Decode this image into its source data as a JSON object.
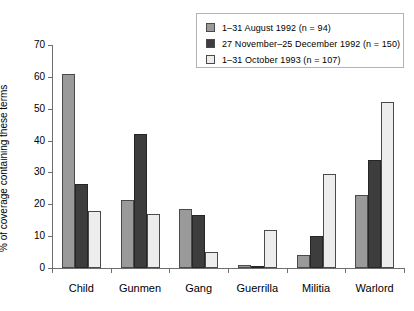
{
  "legend": {
    "entries": [
      {
        "swatch": "light-gray",
        "label": "1–31 August 1992 (n = 94)"
      },
      {
        "swatch": "dark-gray",
        "label": "27 November–25 December 1992 (n = 150)"
      },
      {
        "swatch": "white",
        "label": "1–31 October 1993 (n = 107)"
      }
    ]
  },
  "axes": {
    "ylabel": "% of coverage containing these terms",
    "yticks": [
      "0",
      "10",
      "20",
      "30",
      "40",
      "50",
      "60",
      "70"
    ]
  },
  "chart_data": {
    "type": "bar",
    "title": "",
    "xlabel": "",
    "ylabel": "% of coverage containing these terms",
    "ylim": [
      0,
      70
    ],
    "ytick_step": 10,
    "grid": false,
    "legend_position": "top-right",
    "categories": [
      "Child",
      "Gunmen",
      "Gang",
      "Guerrilla",
      "Militia",
      "Warlord"
    ],
    "series": [
      {
        "name": "1–31 August 1992 (n = 94)",
        "color": "#9a9a9a",
        "values": [
          61,
          21.5,
          18.5,
          1,
          4,
          23
        ]
      },
      {
        "name": "27 November–25 December 1992 (n = 150)",
        "color": "#3d3d3d",
        "values": [
          26.5,
          42,
          16.5,
          0.5,
          10,
          34
        ]
      },
      {
        "name": "1–31 October 1993 (n = 107)",
        "color": "#ededed",
        "values": [
          18,
          17,
          5,
          12,
          29.5,
          52
        ]
      }
    ]
  }
}
